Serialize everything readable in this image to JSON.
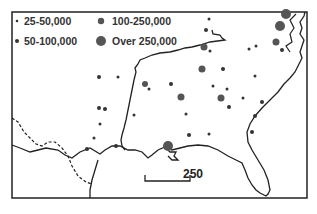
{
  "map": {
    "type": "dot-distribution map",
    "region": "Southeastern United States",
    "legend": {
      "items": [
        {
          "label": "25-50,000",
          "size": "smallest"
        },
        {
          "label": "100-250,000",
          "size": "medium-large"
        },
        {
          "label": "50-100,000",
          "size": "small"
        },
        {
          "label": "Over 250,000",
          "size": "largest"
        }
      ]
    },
    "scale_bar": {
      "label": "250"
    },
    "colors": {
      "ink": "#222222",
      "background": "#ffffff",
      "dot_large": "#555555"
    }
  }
}
